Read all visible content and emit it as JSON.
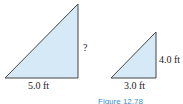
{
  "figure": {
    "caption": "Figure 12.78",
    "fill_color": "#d6e9f6",
    "stroke_color": "#444444",
    "large_triangle": {
      "base_label": "5.0 ft",
      "height_label": "?"
    },
    "small_triangle": {
      "base_label": "3.0 ft",
      "height_label": "4.0 ft"
    }
  }
}
